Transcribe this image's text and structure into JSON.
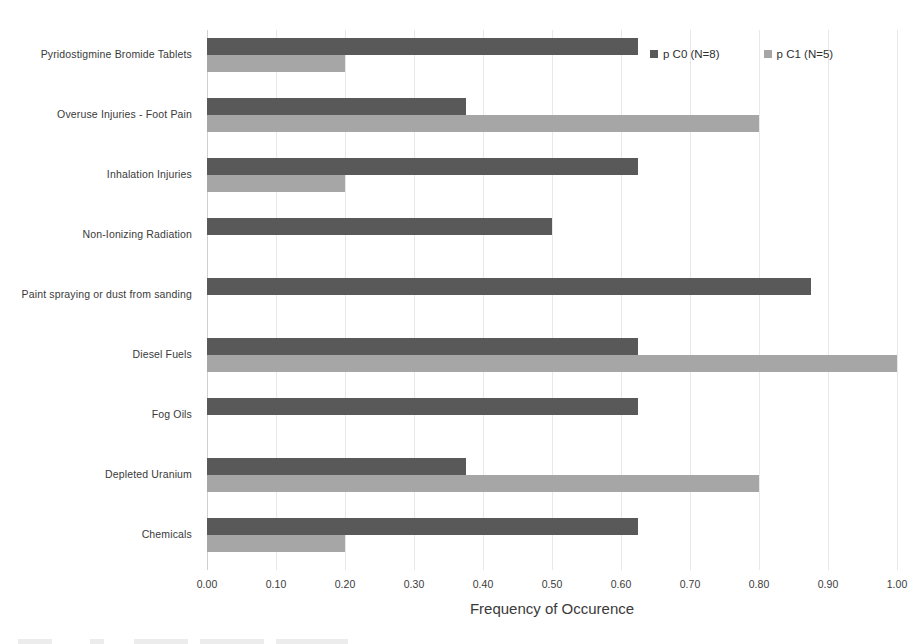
{
  "chart_data": {
    "type": "bar",
    "orientation": "horizontal",
    "title": "",
    "xlabel": "Frequency of Occurence",
    "ylabel": "",
    "xlim": [
      0.0,
      1.0
    ],
    "xticks": [
      "0.00",
      "0.10",
      "0.20",
      "0.30",
      "0.40",
      "0.50",
      "0.60",
      "0.70",
      "0.80",
      "0.90",
      "1.00"
    ],
    "xtick_values": [
      0.0,
      0.1,
      0.2,
      0.3,
      0.4,
      0.5,
      0.6,
      0.7,
      0.8,
      0.9,
      1.0
    ],
    "grid": true,
    "grid_axis": "x",
    "legend_position": "top-right",
    "categories": [
      "Pyridostigmine Bromide Tablets",
      "Overuse Injuries - Foot Pain",
      "Inhalation Injuries",
      "Non-Ionizing Radiation",
      "Paint spraying or dust from sanding",
      "Diesel Fuels",
      "Fog Oils",
      "Depleted Uranium",
      "Chemicals"
    ],
    "series": [
      {
        "name": "p C0 (N=8)",
        "color": "#595959",
        "values": [
          0.625,
          0.375,
          0.625,
          0.5,
          0.875,
          0.625,
          0.625,
          0.375,
          0.625
        ]
      },
      {
        "name": "p C1 (N=5)",
        "color": "#a6a6a6",
        "values": [
          0.2,
          0.8,
          0.2,
          0.0,
          0.0,
          1.0,
          0.0,
          0.8,
          0.2
        ]
      }
    ]
  },
  "legend": {
    "items": [
      {
        "label": "p C0 (N=8)",
        "color": "#595959"
      },
      {
        "label": "p C1 (N=5)",
        "color": "#a6a6a6"
      }
    ]
  },
  "axis": {
    "x_title": "Frequency of Occurence"
  }
}
